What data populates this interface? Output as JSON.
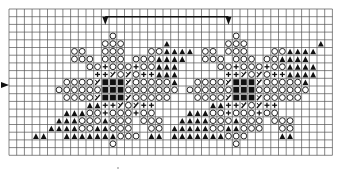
{
  "chart_title": "",
  "grid": {
    "origin_x": 9,
    "origin_y": 9,
    "cell": 7.7,
    "cols": 42,
    "rows": 19,
    "line_color": "#555555",
    "bold_line_color": "#222222"
  },
  "legend": {
    "O": "open-circle",
    "T": "filled-triangle",
    "P": "plus",
    "X": "slash-cell",
    "B": "filled-square",
    ".": "empty"
  },
  "repeat_marker": {
    "start_col": 12,
    "end_col": 28,
    "row_line": 1,
    "label": ""
  },
  "side_marker": {
    "row": 10,
    "symbol": "arrow-right"
  },
  "pattern_rows": [
    "..........................................",
    "..........................................",
    "..........................................",
    ".............O...............O............",
    "............OOO.....T.......OOO.........T.",
    "........OO..OOO...OOTTTT.OO.OOO...OOTTTT..",
    "........OOO.OOO.OOOTTTT..OOO.OOO.OOTTTT...",
    "..........OOPOOOPOOTTT.....OOPOOOPOOTTTT..",
    "...........PPXOXOPPTTT......PPXOXOPPTTTT..",
    ".......OOOOXBBBXOOOOOT..OOOOXBBBXOOOOOT...",
    "......OOOOOOBBBOOOOOOO.OOOOOOBBBOOOOOOO...",
    ".......OOOOXBBBXOOOOO...OOOOXBBBXOOOOO....",
    "..........TTPPXOXPP.......TTPPXOXPP.......",
    ".......TTTOOPOOOPOO....TTTOOPOOOPOO.......",
    "......TTTOOOTOOO.OOO..TTTTOOOTOOO.OOO.....",
    ".....TTTTOOTTOOO..OO.TTTTTOOTTOOO..OO.....",
    "...TT..TTTTTTTOOO.TT.TTTTTTTOOO....TT.....",
    ".............O...............O............",
    ".........................................."
  ]
}
